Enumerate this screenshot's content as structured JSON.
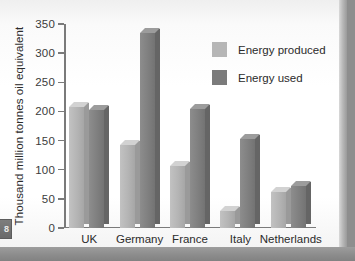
{
  "page": {
    "tab_marker": "8"
  },
  "chart_data": {
    "type": "bar",
    "title": "",
    "xlabel": "",
    "ylabel": "Thousand million tonnes oil equivalent",
    "ylim": [
      0,
      350
    ],
    "yticks": [
      0,
      50,
      100,
      150,
      200,
      250,
      300,
      350
    ],
    "ytick_labels": [
      "0",
      "50",
      "100",
      "150",
      "200",
      "250",
      "300",
      "350"
    ],
    "grid": false,
    "legend_position": "upper right",
    "categories": [
      "UK",
      "Germany",
      "France",
      "Italy",
      "Netherlands"
    ],
    "series": [
      {
        "name": "Energy produced",
        "color": "#b6b6b6",
        "values": [
          207,
          143,
          107,
          30,
          62
        ]
      },
      {
        "name": "Energy used",
        "color": "#7b7b7b",
        "values": [
          203,
          335,
          205,
          153,
          72
        ]
      }
    ],
    "annotations": []
  },
  "legend": {
    "items": [
      {
        "label": "Energy produced",
        "color": "#b6b6b6"
      },
      {
        "label": "Energy used",
        "color": "#7b7b7b"
      }
    ]
  }
}
